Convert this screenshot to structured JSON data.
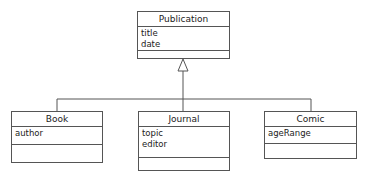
{
  "diagram": {
    "parent": {
      "name": "Publication",
      "attributes": [
        "title",
        "date"
      ],
      "operations": []
    },
    "children": [
      {
        "name": "Book",
        "attributes": [
          "author"
        ],
        "operations": []
      },
      {
        "name": "Journal",
        "attributes": [
          "topic",
          "editor"
        ],
        "operations": []
      },
      {
        "name": "Comic",
        "attributes": [
          "ageRange"
        ],
        "operations": []
      }
    ],
    "relationship": "generalization"
  }
}
